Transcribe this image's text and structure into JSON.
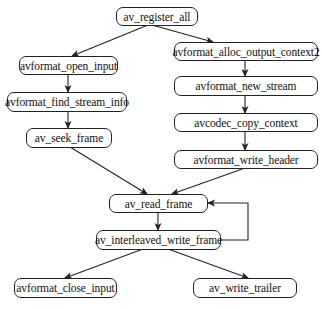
{
  "diagram": {
    "type": "flowchart",
    "nodes": {
      "register_all": "av_register_all",
      "open_input": "avformat_open_input",
      "find_stream_info": "avformat_find_stream_info",
      "seek_frame": "av_seek_frame",
      "alloc_output_context2": "avformat_alloc_output_context2",
      "new_stream": "avformat_new_stream",
      "copy_context": "avcodec_copy_context",
      "write_header": "avformat_write_header",
      "read_frame": "av_read_frame",
      "interleaved_write_frame": "av_interleaved_write_frame",
      "close_input": "avformat_close_input",
      "write_trailer": "av_write_trailer"
    },
    "edges": [
      [
        "av_register_all",
        "avformat_open_input"
      ],
      [
        "av_register_all",
        "avformat_alloc_output_context2"
      ],
      [
        "avformat_open_input",
        "avformat_find_stream_info"
      ],
      [
        "avformat_find_stream_info",
        "av_seek_frame"
      ],
      [
        "avformat_alloc_output_context2",
        "avformat_new_stream"
      ],
      [
        "avformat_new_stream",
        "avcodec_copy_context"
      ],
      [
        "avcodec_copy_context",
        "avformat_write_header"
      ],
      [
        "av_seek_frame",
        "av_read_frame"
      ],
      [
        "avformat_write_header",
        "av_read_frame"
      ],
      [
        "av_read_frame",
        "av_interleaved_write_frame"
      ],
      [
        "av_interleaved_write_frame",
        "av_read_frame"
      ],
      [
        "av_interleaved_write_frame",
        "avformat_close_input"
      ],
      [
        "av_interleaved_write_frame",
        "av_write_trailer"
      ]
    ],
    "colors": {
      "stroke": "#222222",
      "background": "#ffffff",
      "text": "#111111"
    }
  }
}
